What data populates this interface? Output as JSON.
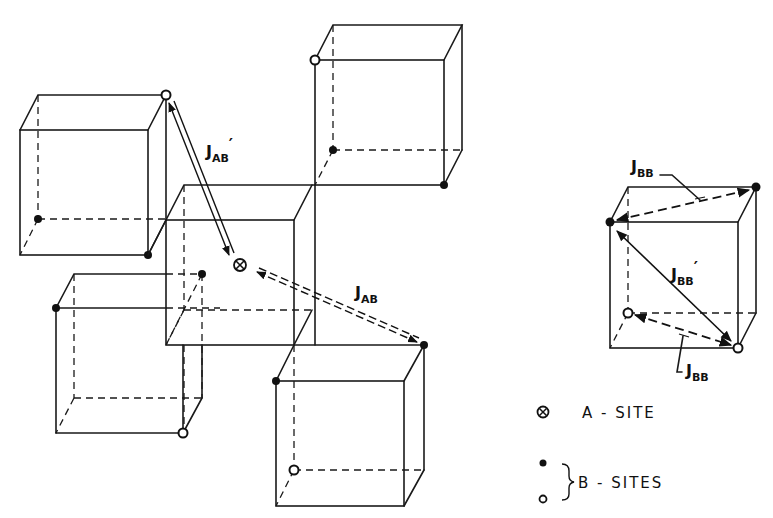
{
  "figure": {
    "type": "crystal-lattice exchange diagram",
    "background": "#ffffff",
    "ink": "#111111"
  },
  "cubes": [
    {
      "id": "upper-left",
      "front": [
        20,
        130,
        148,
        255
      ],
      "offset": [
        18,
        -35
      ],
      "sites": [
        {
          "x": 166,
          "y": 95,
          "kind": "open"
        },
        {
          "x": 38,
          "y": 219,
          "kind": "filled"
        },
        {
          "x": 148,
          "y": 255,
          "kind": "filled"
        }
      ]
    },
    {
      "id": "center",
      "front": [
        166,
        220,
        294,
        345
      ],
      "offset": [
        18,
        -35
      ],
      "sites": []
    },
    {
      "id": "top-right",
      "front": [
        315,
        60,
        444,
        185
      ],
      "offset": [
        18,
        -35
      ],
      "sites": [
        {
          "x": 315,
          "y": 60,
          "kind": "open"
        },
        {
          "x": 333,
          "y": 150,
          "kind": "filled"
        },
        {
          "x": 444,
          "y": 185,
          "kind": "filled"
        }
      ]
    },
    {
      "id": "lower-left",
      "front": [
        56,
        308,
        183,
        433
      ],
      "offset": [
        18,
        -34
      ],
      "sites": [
        {
          "x": 56,
          "y": 308,
          "kind": "filled"
        },
        {
          "x": 202,
          "y": 274,
          "kind": "filled"
        },
        {
          "x": 183,
          "y": 433,
          "kind": "open"
        }
      ]
    },
    {
      "id": "lower-right",
      "front": [
        276,
        381,
        404,
        506
      ],
      "offset": [
        20,
        -36
      ],
      "sites": [
        {
          "x": 276,
          "y": 381,
          "kind": "filled"
        },
        {
          "x": 424,
          "y": 345,
          "kind": "filled"
        },
        {
          "x": 294,
          "y": 470,
          "kind": "open"
        }
      ]
    },
    {
      "id": "right-bb",
      "front": [
        610,
        222,
        738,
        348
      ],
      "offset": [
        18,
        -35
      ],
      "sites": [
        {
          "x": 610,
          "y": 222,
          "kind": "filled"
        },
        {
          "x": 756,
          "y": 187,
          "kind": "filled"
        },
        {
          "x": 628,
          "y": 313,
          "kind": "open"
        },
        {
          "x": 738,
          "y": 348,
          "kind": "open"
        }
      ]
    }
  ],
  "a_site": {
    "x": 240,
    "y": 265
  },
  "interactions": [
    {
      "name": "J_AB_prime",
      "main": "J",
      "sub": "AB",
      "prime": "′",
      "style": "double-solid",
      "from": [
        171,
        101
      ],
      "to": [
        233,
        255
      ],
      "label_pos": [
        206,
        162
      ]
    },
    {
      "name": "J_AB",
      "main": "J",
      "sub": "AB",
      "prime": "",
      "style": "double-dashed",
      "from": [
        418,
        343
      ],
      "to": [
        256,
        273
      ],
      "label_pos": [
        355,
        303
      ]
    },
    {
      "name": "J_BB_prime",
      "main": "J",
      "sub": "BB",
      "prime": "′",
      "style": "solid",
      "from": [
        617,
        232
      ],
      "to": [
        733,
        342
      ],
      "label_pos": [
        672,
        283
      ]
    },
    {
      "name": "J_BB_top",
      "main": "J",
      "sub": "BB",
      "prime": "",
      "style": "dashed",
      "from": [
        615,
        221
      ],
      "to": [
        750,
        190
      ],
      "label_pos": [
        631,
        175
      ]
    },
    {
      "name": "J_BB_bottom",
      "main": "J",
      "sub": "BB",
      "prime": "",
      "style": "dashed",
      "from": [
        634,
        314
      ],
      "to": [
        733,
        346
      ],
      "label_pos": [
        686,
        378
      ]
    }
  ],
  "labels": {
    "jab_prime": {
      "main": "J",
      "sub": "AB",
      "prime": "′"
    },
    "jab": {
      "main": "J",
      "sub": "AB"
    },
    "jbb_prime": {
      "main": "J",
      "sub": "BB",
      "prime": "′"
    },
    "jbb_top": {
      "main": "J",
      "sub": "BB"
    },
    "jbb_bottom": {
      "main": "J",
      "sub": "BB"
    }
  },
  "legend": {
    "a_site_label": "A - SITE",
    "b_sites_label": "B - SITES",
    "a_symbol": "⊗",
    "b_symbols": [
      "filled-circle",
      "open-circle"
    ]
  }
}
